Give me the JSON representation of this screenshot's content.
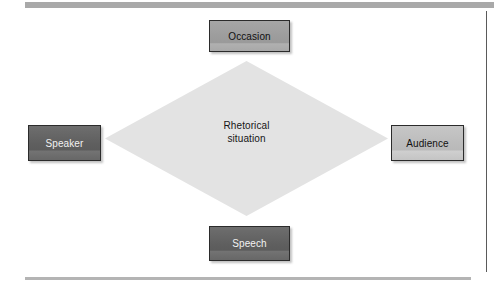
{
  "figure": {
    "type": "rhetorical-situation-diamond",
    "center": {
      "line1": "Rhetorical",
      "line2": "situation"
    },
    "nodes": [
      {
        "id": "occasion",
        "label": "Occasion",
        "position": "top",
        "fill": "#9c9c9c"
      },
      {
        "id": "speaker",
        "label": "Speaker",
        "position": "left",
        "fill": "#5f5f5f"
      },
      {
        "id": "audience",
        "label": "Audience",
        "position": "right",
        "fill": "#bcbcbc"
      },
      {
        "id": "speech",
        "label": "Speech",
        "position": "bottom",
        "fill": "#5f5f5f"
      }
    ],
    "colors": {
      "diamond_fill": "#e3e3e3",
      "page_background": "#ffffff",
      "rule": "#a9a9a9",
      "frame_line": "#5a5a5a",
      "node_border": "#2b2b2b"
    }
  }
}
